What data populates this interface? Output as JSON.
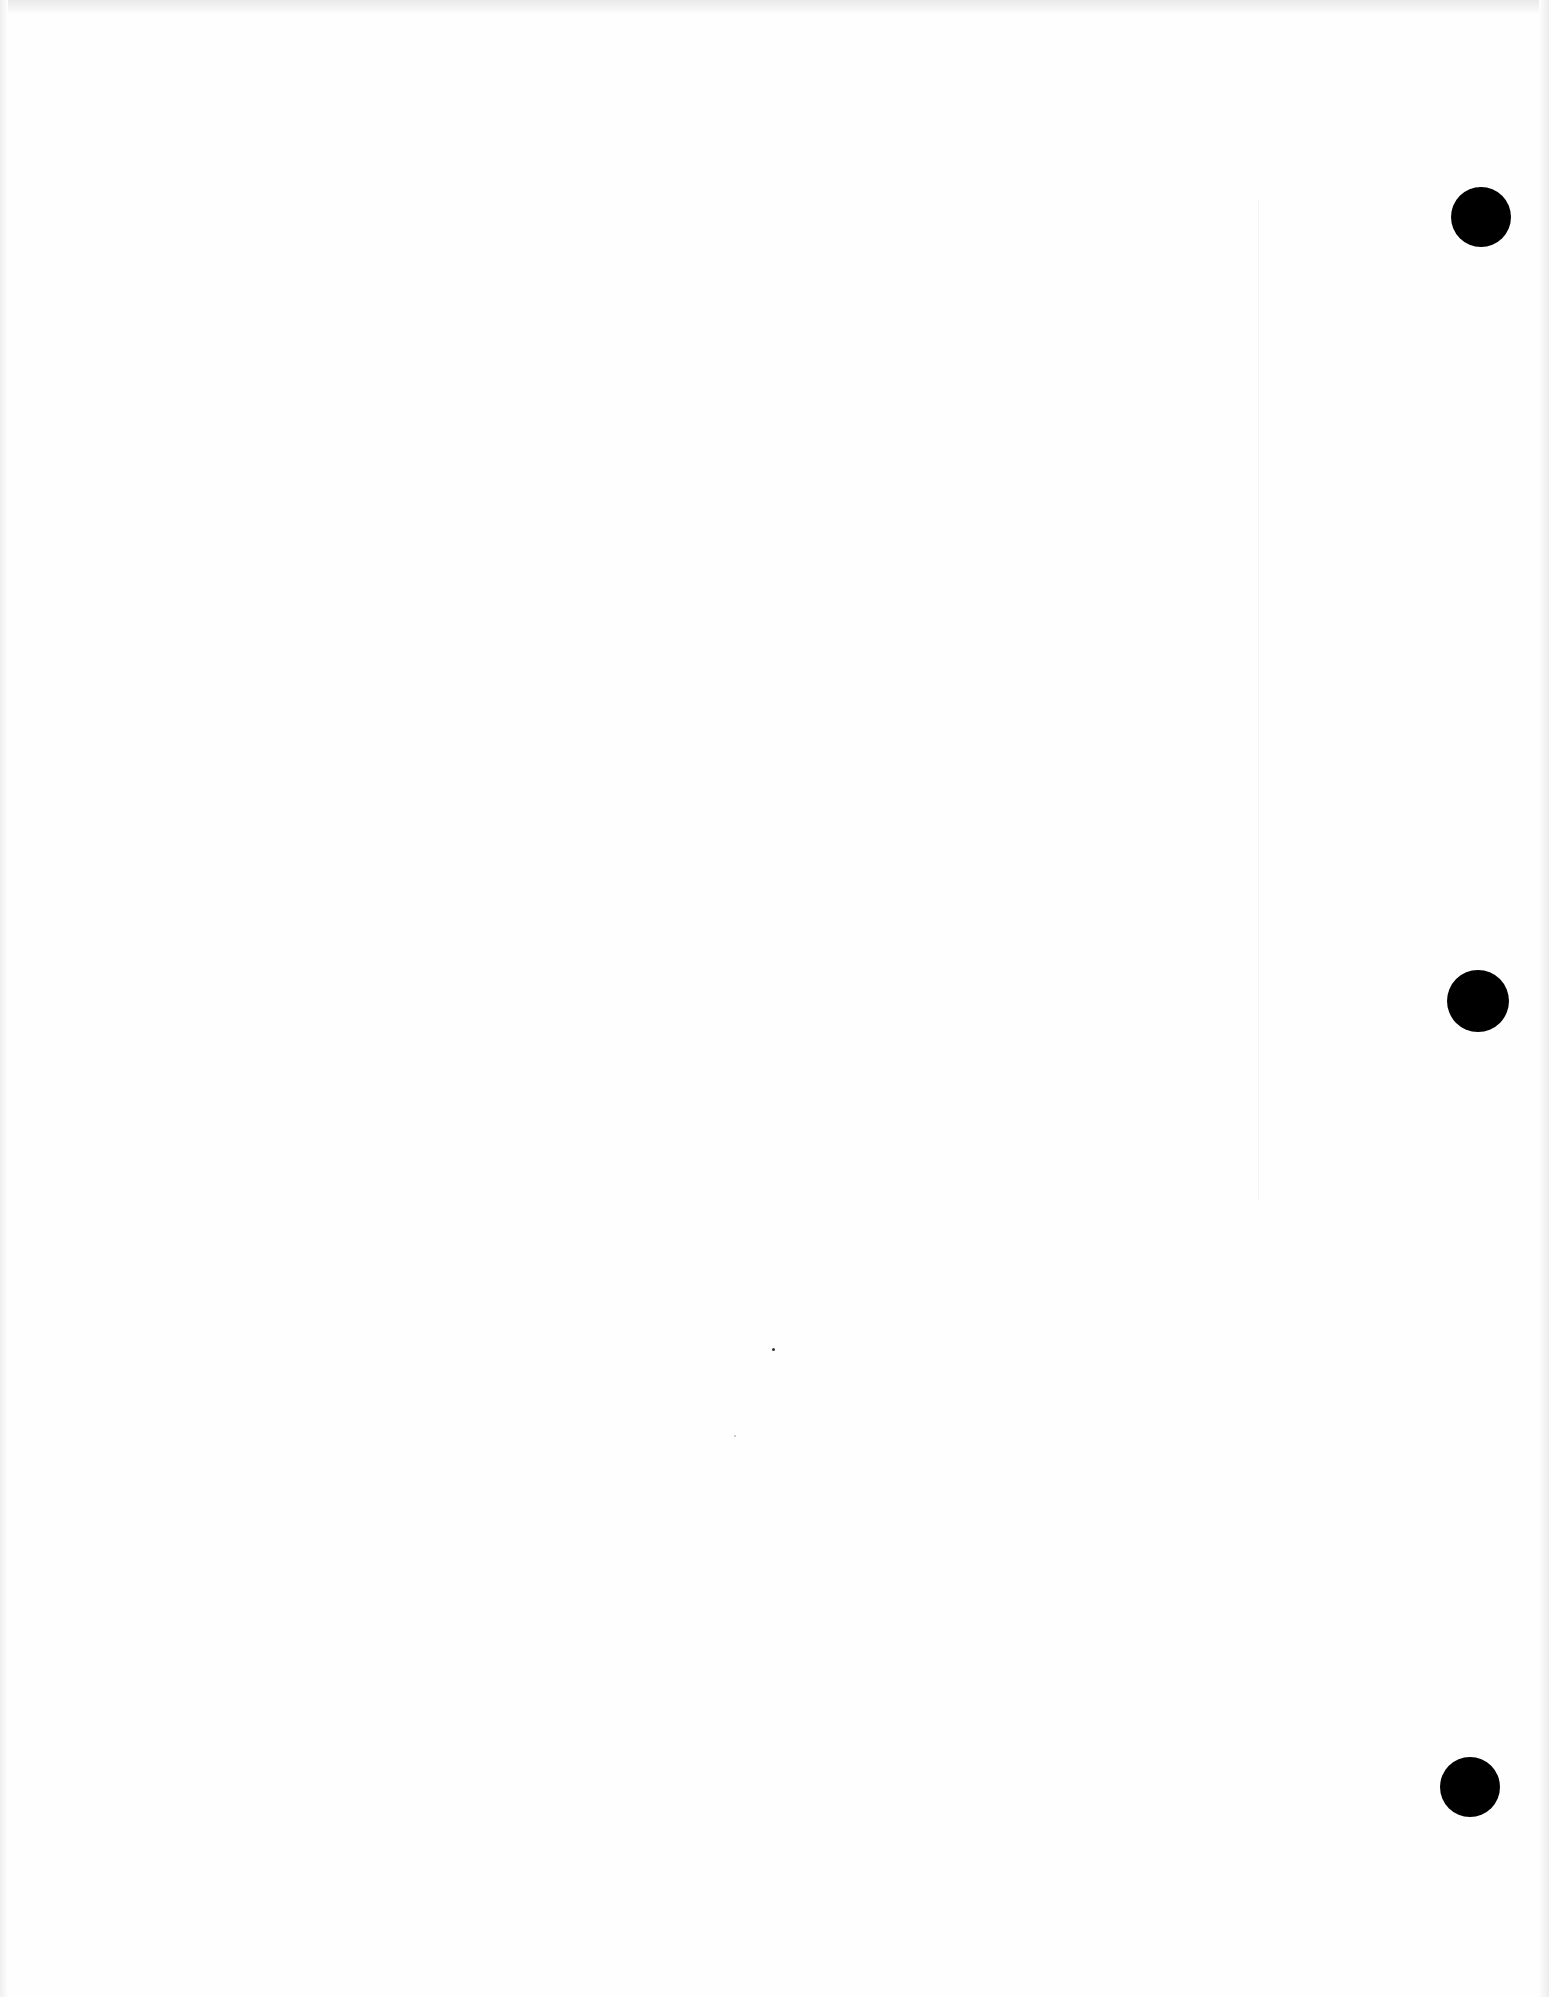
{
  "page": {
    "type": "blank scanned sheet",
    "background_color": "#fefefe",
    "content_text": ""
  },
  "punch_holes": [
    {
      "label": "top",
      "cx": 1481,
      "cy": 217,
      "r": 30,
      "color": "#000000"
    },
    {
      "label": "middle",
      "cx": 1478,
      "cy": 1001,
      "r": 31,
      "color": "#000000"
    },
    {
      "label": "bottom",
      "cx": 1470,
      "cy": 1787,
      "r": 30,
      "color": "#000000"
    }
  ],
  "specks": [
    {
      "x": 772,
      "y": 1348,
      "shade": "dark"
    },
    {
      "x": 734,
      "y": 1435,
      "shade": "light"
    }
  ]
}
